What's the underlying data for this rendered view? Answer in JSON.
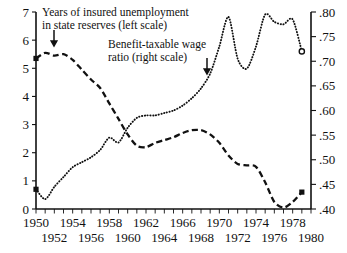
{
  "chart_data": {
    "type": "line",
    "title": "",
    "xlabel": "",
    "ylabel": "",
    "xlim": [
      1950,
      1980
    ],
    "grid": false,
    "legend_position": "inline-annotations",
    "axes": {
      "left": {
        "label": "Years of insured unemployment in state reserves",
        "lim": [
          0,
          7
        ],
        "ticks": [
          0,
          1,
          2,
          3,
          4,
          5,
          6,
          7
        ],
        "tick_labels": [
          "0",
          "1",
          "2",
          "3",
          "4",
          "5",
          "6",
          "7"
        ]
      },
      "right": {
        "label": "Benefit-taxable wage ratio",
        "lim": [
          0.4,
          0.8
        ],
        "ticks": [
          0.4,
          0.45,
          0.5,
          0.55,
          0.6,
          0.65,
          0.7,
          0.75,
          0.8
        ],
        "tick_labels": [
          ".40",
          ".45",
          ".50",
          ".55",
          ".60",
          ".65",
          ".70",
          ".75",
          ".80"
        ]
      },
      "bottom": {
        "tick_years": [
          1950,
          1951,
          1952,
          1953,
          1954,
          1955,
          1956,
          1957,
          1958,
          1959,
          1960,
          1961,
          1962,
          1963,
          1964,
          1965,
          1966,
          1967,
          1968,
          1969,
          1970,
          1971,
          1972,
          1973,
          1974,
          1975,
          1976,
          1977,
          1978,
          1979,
          1980
        ],
        "labels_row_top": [
          "1950",
          "1954",
          "1958",
          "1962",
          "1966",
          "1970",
          "1974",
          "1978"
        ],
        "labels_row_bottom": [
          "1952",
          "1956",
          "1960",
          "1964",
          "1968",
          "1972",
          "1976",
          "1980"
        ]
      }
    },
    "annotations": [
      {
        "name": "reserves-annotation",
        "lines": [
          "Years of insured unemployment",
          "in state reserves (left scale)"
        ],
        "arrow": "down"
      },
      {
        "name": "ratio-annotation",
        "lines": [
          "Benefit-taxable wage",
          "ratio (right scale)"
        ],
        "arrow": "down"
      }
    ],
    "series": [
      {
        "name": "Years of insured unemployment in state reserves (left scale)",
        "style": "dashed",
        "axis": "left",
        "marker_start": "square",
        "marker_end": "square",
        "x": [
          1950,
          1951,
          1952,
          1953,
          1954,
          1955,
          1956,
          1957,
          1958,
          1959,
          1960,
          1961,
          1962,
          1963,
          1964,
          1965,
          1966,
          1967,
          1968,
          1969,
          1970,
          1971,
          1972,
          1973,
          1974,
          1975,
          1976,
          1977,
          1978,
          1979
        ],
        "values": [
          5.35,
          5.55,
          5.45,
          5.5,
          5.3,
          4.95,
          4.6,
          4.3,
          3.75,
          3.2,
          2.65,
          2.25,
          2.2,
          2.35,
          2.45,
          2.55,
          2.7,
          2.8,
          2.8,
          2.65,
          2.35,
          1.9,
          1.6,
          1.55,
          1.5,
          0.95,
          0.25,
          0.05,
          0.25,
          0.6
        ]
      },
      {
        "name": "Benefit-taxable wage ratio (right scale)",
        "style": "dotted",
        "axis": "right",
        "marker_start": "square",
        "marker_end": "circle",
        "x": [
          1950,
          1951,
          1952,
          1953,
          1954,
          1955,
          1956,
          1957,
          1958,
          1959,
          1960,
          1961,
          1962,
          1963,
          1964,
          1965,
          1966,
          1967,
          1968,
          1969,
          1970,
          1971,
          1972,
          1973,
          1974,
          1975,
          1976,
          1977,
          1978,
          1979
        ],
        "values": [
          0.44,
          0.42,
          0.445,
          0.465,
          0.485,
          0.495,
          0.505,
          0.52,
          0.545,
          0.535,
          0.565,
          0.585,
          0.59,
          0.59,
          0.595,
          0.6,
          0.61,
          0.625,
          0.645,
          0.675,
          0.73,
          0.79,
          0.705,
          0.685,
          0.73,
          0.795,
          0.78,
          0.775,
          0.785,
          0.72
        ]
      }
    ]
  }
}
